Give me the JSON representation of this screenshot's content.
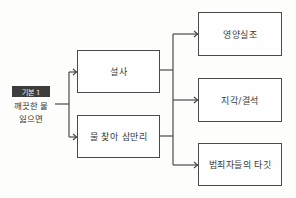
{
  "source": {
    "badge": "기본 1",
    "line1": "깨끗한 물",
    "line2": "잃으면"
  },
  "middle": [
    {
      "label": "설사"
    },
    {
      "label": "물 찾아 삼만리"
    }
  ],
  "outcomes": [
    {
      "label": "영양실조"
    },
    {
      "label": "지각/결석"
    },
    {
      "label": "범죄자들의 타깃"
    }
  ],
  "colors": {
    "line": "#4a4a4a",
    "badge_bg": "#3d3d3d",
    "background": "#fdfdfc"
  }
}
